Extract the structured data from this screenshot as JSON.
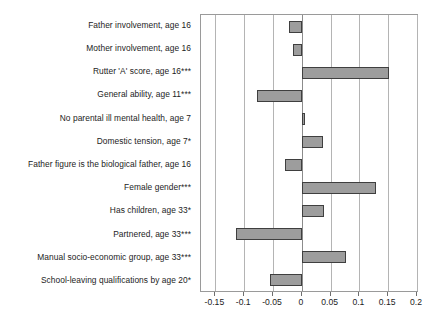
{
  "chart_data": {
    "type": "bar",
    "orientation": "horizontal",
    "title": "",
    "subtitle": "",
    "xlabel": "",
    "ylabel": "",
    "xlim": [
      -0.175,
      0.2
    ],
    "ylim": null,
    "grid": true,
    "legend": null,
    "legend_position": "none",
    "bar_fill_color": "#9d9d9d",
    "bar_border_color": "#3f3f3f",
    "axis_color": "#9a9a9a",
    "gridline_color": "#b4b4b4",
    "xticks": [
      -0.15,
      -0.1,
      -0.05,
      0,
      0.05,
      0.1,
      0.15,
      0.2
    ],
    "xtick_labels": [
      "-0.15",
      "-0.1",
      "-0.05",
      "0",
      "0.05",
      "0.1",
      "0.15",
      "0.2"
    ],
    "categories": [
      "Father involvement, age 16",
      "Mother involvement, age 16",
      "Rutter 'A' score, age 16***",
      "General ability, age 11***",
      "No parental ill mental health, age 7",
      "Domestic tension, age 7*",
      "Father figure is the biological father, age 16",
      "Female gender***",
      "Has children, age 33*",
      "Partnered, age 33***",
      "Manual socio-economic group, age 33***",
      "School-leaving qualifications by age 20*"
    ],
    "values": [
      -0.022,
      -0.016,
      0.152,
      -0.078,
      0.005,
      0.036,
      -0.03,
      0.129,
      0.038,
      -0.115,
      0.077,
      -0.056
    ]
  }
}
